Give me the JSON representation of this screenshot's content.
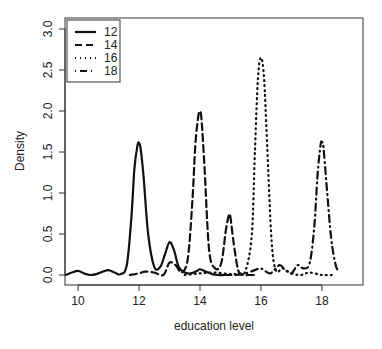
{
  "chart_data": {
    "type": "line",
    "title": "",
    "xlabel": "education level",
    "ylabel": "Density",
    "xlim": [
      9.6,
      18.9
    ],
    "ylim": [
      -0.12,
      3.14
    ],
    "x_ticks": [
      10,
      12,
      14,
      16,
      18
    ],
    "y_ticks": [
      0.0,
      0.5,
      1.0,
      1.5,
      2.0,
      2.5,
      3.0
    ],
    "y_tick_labels": [
      "0.0",
      "0.5",
      "1.0",
      "1.5",
      "2.0",
      "2.5",
      "3.0"
    ],
    "grid": false,
    "legend": {
      "position": "top-left",
      "entries": [
        "12",
        "14",
        "16",
        "18"
      ]
    },
    "series": [
      {
        "name": "12",
        "style": "solid",
        "x": [
          9.6,
          9.8,
          10.0,
          10.2,
          10.4,
          10.6,
          10.8,
          11.0,
          11.2,
          11.4,
          11.6,
          11.75,
          11.85,
          11.95,
          12.0,
          12.05,
          12.15,
          12.3,
          12.5,
          12.7,
          12.85,
          13.0,
          13.15,
          13.3,
          13.5,
          13.7,
          13.9,
          14.0,
          14.2,
          14.4,
          14.6,
          14.8,
          15.0
        ],
        "values": [
          0.0,
          0.03,
          0.05,
          0.02,
          0.0,
          0.01,
          0.04,
          0.06,
          0.03,
          0.01,
          0.12,
          0.7,
          1.3,
          1.58,
          1.61,
          1.55,
          1.2,
          0.5,
          0.1,
          0.1,
          0.25,
          0.4,
          0.3,
          0.1,
          0.03,
          0.02,
          0.05,
          0.07,
          0.04,
          0.01,
          0.0,
          0.0,
          0.0
        ]
      },
      {
        "name": "14",
        "style": "dashed",
        "x": [
          11.7,
          12.0,
          12.2,
          12.5,
          12.8,
          13.0,
          13.2,
          13.4,
          13.6,
          13.75,
          13.85,
          13.95,
          14.0,
          14.05,
          14.15,
          14.3,
          14.5,
          14.7,
          14.85,
          14.95,
          15.0,
          15.1,
          15.25,
          15.4,
          15.6,
          15.8
        ],
        "values": [
          0.0,
          0.02,
          0.04,
          0.03,
          0.0,
          0.15,
          0.12,
          0.03,
          0.2,
          0.9,
          1.6,
          1.95,
          1.99,
          1.9,
          1.3,
          0.3,
          0.08,
          0.15,
          0.55,
          0.73,
          0.7,
          0.4,
          0.06,
          0.0,
          0.0,
          0.0
        ]
      },
      {
        "name": "16",
        "style": "dotted",
        "x": [
          13.5,
          14.0,
          14.5,
          15.0,
          15.3,
          15.5,
          15.7,
          15.8,
          15.9,
          16.0,
          16.1,
          16.2,
          16.35,
          16.5,
          16.7,
          17.0,
          17.3,
          17.6,
          18.0,
          18.4
        ],
        "values": [
          0.0,
          0.02,
          0.03,
          0.01,
          0.02,
          0.06,
          0.5,
          1.5,
          2.4,
          2.65,
          2.4,
          1.6,
          0.4,
          0.05,
          0.08,
          0.02,
          0.0,
          0.03,
          0.0,
          0.0
        ]
      },
      {
        "name": "18",
        "style": "dotdash",
        "x": [
          15.0,
          15.4,
          15.8,
          16.0,
          16.3,
          16.6,
          16.8,
          17.0,
          17.2,
          17.4,
          17.6,
          17.75,
          17.85,
          17.95,
          18.0,
          18.05,
          18.15,
          18.3,
          18.45,
          18.55
        ],
        "values": [
          0.0,
          0.01,
          0.06,
          0.08,
          0.02,
          0.12,
          0.06,
          0.02,
          0.12,
          0.08,
          0.15,
          0.6,
          1.2,
          1.58,
          1.62,
          1.55,
          1.1,
          0.45,
          0.12,
          0.05
        ]
      }
    ]
  }
}
